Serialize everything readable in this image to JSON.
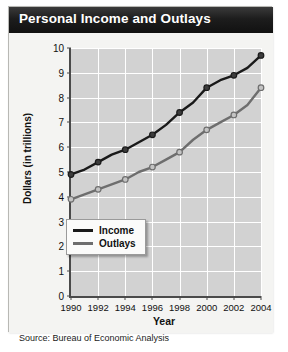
{
  "figure": {
    "title": "Personal Income and Outlays",
    "source": "Source: Bureau of Economic Analysis"
  },
  "legend": {
    "income_label": "Income",
    "outlays_label": "Outlays"
  },
  "colors": {
    "income": "#1a1a1a",
    "outlays": "#6e6e6e",
    "plot_background": "#d2d2d2",
    "gridline": "#ffffff",
    "axis": "#4a4a4a",
    "title_bar": "#161616",
    "title_text": "#ffffff",
    "card_background": "#f2f2f0"
  },
  "chart_data": {
    "type": "line",
    "title": "Personal Income and Outlays",
    "xlabel": "Year",
    "ylabel": "Dollars (in trillions)",
    "xlim": [
      1990,
      2004
    ],
    "ylim": [
      0,
      10
    ],
    "yticks": [
      0,
      1,
      2,
      3,
      4,
      5,
      6,
      7,
      8,
      9,
      10
    ],
    "xticks": [
      1990,
      1992,
      1994,
      1996,
      1998,
      2000,
      2002,
      2004
    ],
    "xtick_labels": [
      "1990",
      "1992",
      "1994",
      "1996",
      "1998",
      "2000",
      "2002",
      "2004"
    ],
    "ytick_labels": [
      "0",
      "1",
      "2",
      "3",
      "4",
      "5",
      "6",
      "7",
      "8",
      "9",
      "10"
    ],
    "grid": true,
    "legend_position": "lower center inside",
    "annotation": "Source: Bureau of Economic Analysis",
    "x": [
      1990,
      1991,
      1992,
      1993,
      1994,
      1995,
      1996,
      1997,
      1998,
      1999,
      2000,
      2001,
      2002,
      2003,
      2004
    ],
    "series": [
      {
        "name": "Income",
        "values": [
          4.9,
          5.1,
          5.4,
          5.7,
          5.9,
          6.2,
          6.5,
          6.9,
          7.4,
          7.8,
          8.4,
          8.7,
          8.9,
          9.2,
          9.7
        ]
      },
      {
        "name": "Outlays",
        "values": [
          3.9,
          4.1,
          4.3,
          4.5,
          4.7,
          5.0,
          5.2,
          5.5,
          5.8,
          6.3,
          6.7,
          7.0,
          7.3,
          7.7,
          8.4
        ]
      }
    ]
  }
}
